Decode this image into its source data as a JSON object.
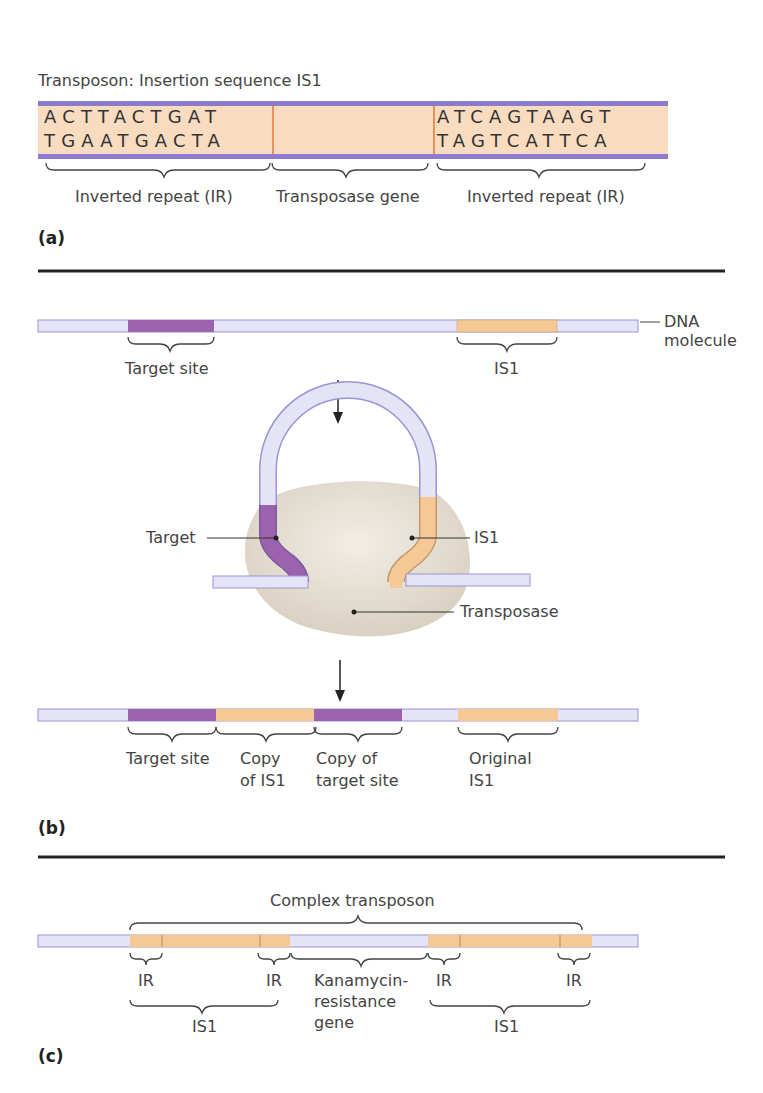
{
  "colors": {
    "dna_backbone": "#e4e4f6",
    "dna_edge": "#9a94d6",
    "strand_purple": "#8c7ad0",
    "target_site": "#9b62ad",
    "is1": "#f6c896",
    "is1_box": "#f9dcbf",
    "transposase": "#e6e0d4",
    "divider": "#222222",
    "orange_line": "#e07a3a"
  },
  "panel_a": {
    "title": "Transposon: Insertion sequence IS1",
    "left_ir": {
      "top": "ACTTACTGAT",
      "bottom": "TGAATGACTA"
    },
    "right_ir": {
      "top": "ATCAGTAAGT",
      "bottom": "TAGTCATTCA"
    },
    "labels": [
      "Inverted repeat (IR)",
      "Transposase gene",
      "Inverted repeat (IR)"
    ],
    "tag": "(a)"
  },
  "panel_b": {
    "top_labels": {
      "target_site": "Target site",
      "is1": "IS1",
      "dna_line1": "DNA",
      "dna_line2": "molecule"
    },
    "complex_labels": {
      "target": "Target",
      "is1": "IS1",
      "transposase": "Transposase"
    },
    "result_labels": {
      "target_site": "Target site",
      "copy_is1_line1": "Copy",
      "copy_is1_line2": "of IS1",
      "copy_target_line1": "Copy of",
      "copy_target_line2": "target site",
      "original_line1": "Original",
      "original_line2": "IS1"
    },
    "tag": "(b)"
  },
  "panel_c": {
    "title": "Complex transposon",
    "ir_labels": [
      "IR",
      "IR",
      "IR",
      "IR"
    ],
    "is1_labels": [
      "IS1",
      "IS1"
    ],
    "kan_line1": "Kanamycin-",
    "kan_line2": "resistance",
    "kan_line3": "gene",
    "tag": "(c)"
  }
}
